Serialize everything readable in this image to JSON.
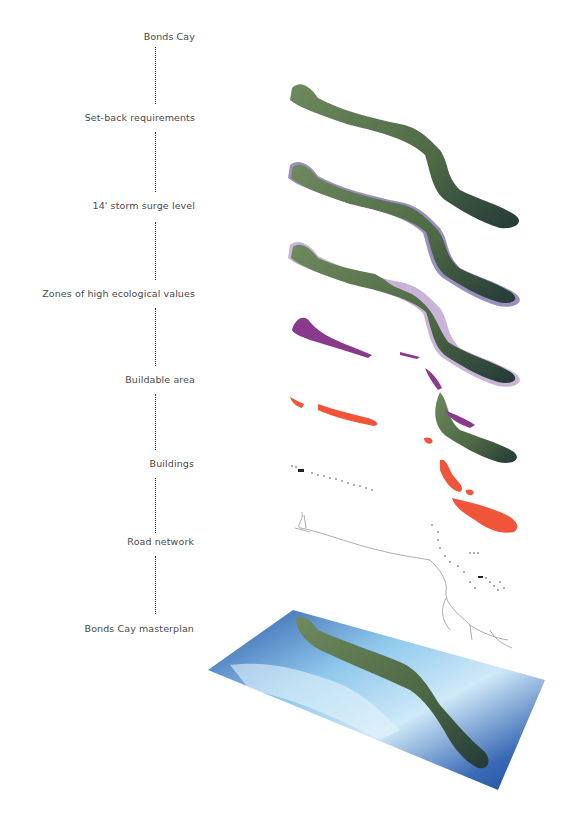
{
  "diagram": {
    "title": "Bonds Cay",
    "layers": [
      {
        "label": "Set-back requirements",
        "overlay_color": "#9a8fc0"
      },
      {
        "label": "14' storm surge level",
        "overlay_color": "#c9b3d8"
      },
      {
        "label": "Zones of high ecological values",
        "overlay_color": "#8a3a8a"
      },
      {
        "label": "Buildable area",
        "overlay_color": "#f0553a"
      },
      {
        "label": "Buildings",
        "overlay_color": "#222222"
      },
      {
        "label": "Road network",
        "overlay_color": "#888888"
      },
      {
        "label": "Bonds Cay masterplan",
        "overlay_color": "#2f5fa8"
      }
    ],
    "colors": {
      "island_green": "#4f6a45",
      "ocean_deep": "#2a57a6",
      "ocean_light": "#a9d6f0",
      "label_text": "#4a4a4a"
    }
  }
}
